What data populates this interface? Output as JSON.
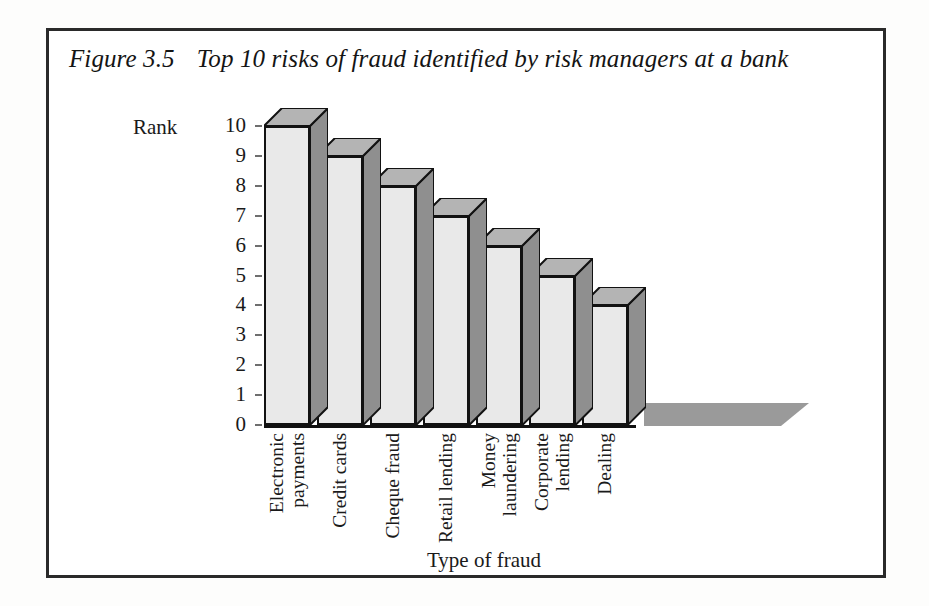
{
  "figure": {
    "number": "Figure 3.5",
    "caption": "Top 10 risks of fraud identified by risk managers at a bank"
  },
  "chart_data": {
    "type": "bar",
    "title": "Top 10 risks of fraud identified by risk managers at a bank",
    "xlabel": "Type of fraud",
    "ylabel": "Rank",
    "categories": [
      "Electronic payments",
      "Credit cards",
      "Cheque fraud",
      "Retail lending",
      "Money laundering",
      "Corporate lending",
      "Dealing"
    ],
    "category_lines": [
      [
        "Electronic",
        "payments"
      ],
      [
        "Credit cards"
      ],
      [
        "Cheque fraud"
      ],
      [
        "Retail lending"
      ],
      [
        "Money",
        "laundering"
      ],
      [
        "Corporate",
        "lending"
      ],
      [
        "Dealing"
      ]
    ],
    "values": [
      10,
      9,
      8,
      7,
      6,
      5,
      4
    ],
    "ylim": [
      0,
      10
    ],
    "yticks": [
      10,
      9,
      8,
      7,
      6,
      5,
      4,
      3,
      2,
      1,
      0
    ],
    "ytick_labels": [
      "10",
      "9",
      "8",
      "7",
      "6",
      "5",
      "4",
      "3",
      "2",
      "1",
      "0"
    ],
    "grid": false,
    "legend": null,
    "style": "3d-column",
    "colors": {
      "bar_front": "#e9e9e9",
      "bar_top": "#b4b4b4",
      "bar_side": "#8f8f8f",
      "outline": "#121212",
      "floor": "#9a9a9a",
      "frame": "#2a2a2a",
      "background": "#ffffff"
    }
  }
}
